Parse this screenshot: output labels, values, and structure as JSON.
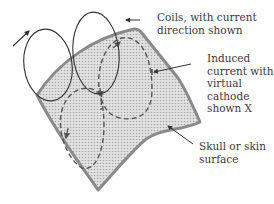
{
  "diagram": {
    "labels": {
      "coils": "Coils, with current\ndirection shown",
      "induced_current": "Induced\ncurrent with\nvirtual\ncathode\nshown X",
      "surface": "Skull or skin\nsurface"
    },
    "colors": {
      "surface_fill": "#d4d4d4",
      "surface_edge": "#8a8a8a",
      "coil_stroke": "#333333",
      "dashed_stroke": "#555555",
      "text": "#3a3a3a"
    }
  }
}
